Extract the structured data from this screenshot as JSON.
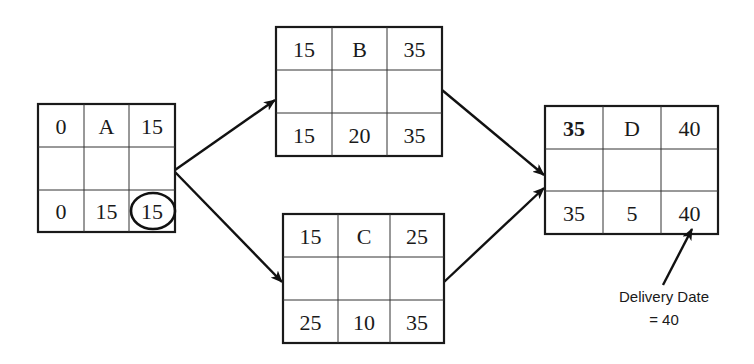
{
  "diagram": {
    "type": "network-diagram-critical-path",
    "nodes": [
      {
        "id": "A",
        "box": {
          "x": 38,
          "y": 104,
          "w": 137,
          "h": 128,
          "cols": [
            84,
            129
          ],
          "rows": [
            147,
            190
          ]
        },
        "top": [
          "0",
          "A",
          "15"
        ],
        "bottom": [
          "0",
          "15",
          "15"
        ],
        "bold_top_left": false,
        "circled_bottom_right": true
      },
      {
        "id": "B",
        "box": {
          "x": 276,
          "y": 27,
          "w": 166,
          "h": 129,
          "cols": [
            332,
            387
          ],
          "rows": [
            70,
            113
          ]
        },
        "top": [
          "15",
          "B",
          "35"
        ],
        "bottom": [
          "15",
          "20",
          "35"
        ],
        "bold_top_left": false,
        "circled_bottom_right": false
      },
      {
        "id": "C",
        "box": {
          "x": 283,
          "y": 214,
          "w": 161,
          "h": 129,
          "cols": [
            338,
            390
          ],
          "rows": [
            257,
            300
          ]
        },
        "top": [
          "15",
          "C",
          "25"
        ],
        "bottom": [
          "25",
          "10",
          "35"
        ],
        "bold_top_left": false,
        "circled_bottom_right": false
      },
      {
        "id": "D",
        "box": {
          "x": 545,
          "y": 106,
          "w": 173,
          "h": 128,
          "cols": [
            603,
            661
          ],
          "rows": [
            149,
            191
          ]
        },
        "top": [
          "35",
          "D",
          "40"
        ],
        "bottom": [
          "35",
          "5",
          "40"
        ],
        "bold_top_left": true,
        "circled_bottom_right": false
      }
    ],
    "edges": [
      {
        "from": "A",
        "to": "B",
        "x1": 175,
        "y1": 170,
        "x2": 275,
        "y2": 100
      },
      {
        "from": "A",
        "to": "C",
        "x1": 175,
        "y1": 172,
        "x2": 282,
        "y2": 282
      },
      {
        "from": "B",
        "to": "D",
        "x1": 442,
        "y1": 90,
        "x2": 544,
        "y2": 175
      },
      {
        "from": "C",
        "to": "D",
        "x1": 444,
        "y1": 282,
        "x2": 544,
        "y2": 188
      }
    ],
    "annotation": {
      "line1": "Delivery Date",
      "line2": "= 40",
      "arrow": {
        "x1": 663,
        "y1": 285,
        "x2": 692,
        "y2": 229
      }
    },
    "colors": {
      "line": "#1a1a1a",
      "background": "#ffffff"
    }
  }
}
